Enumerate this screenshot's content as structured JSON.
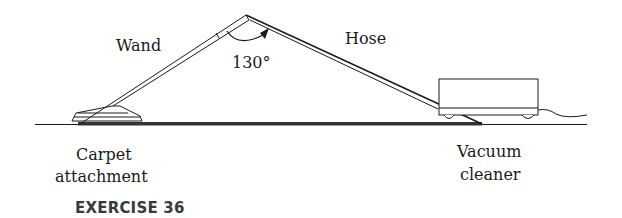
{
  "diagram": {
    "labels": {
      "wand": "Wand",
      "hose": "Hose",
      "angle": "130°",
      "carpet_line1": "Carpet",
      "carpet_line2": "attachment",
      "vacuum_line1": "Vacuum",
      "vacuum_line2": "cleaner"
    },
    "caption": "EXERCISE 36",
    "angle_degrees": 130,
    "colors": {
      "stroke": "#1a1a1a",
      "floor_band": "#333333",
      "caption": "#3a3a3a",
      "background": "#ffffff"
    }
  }
}
